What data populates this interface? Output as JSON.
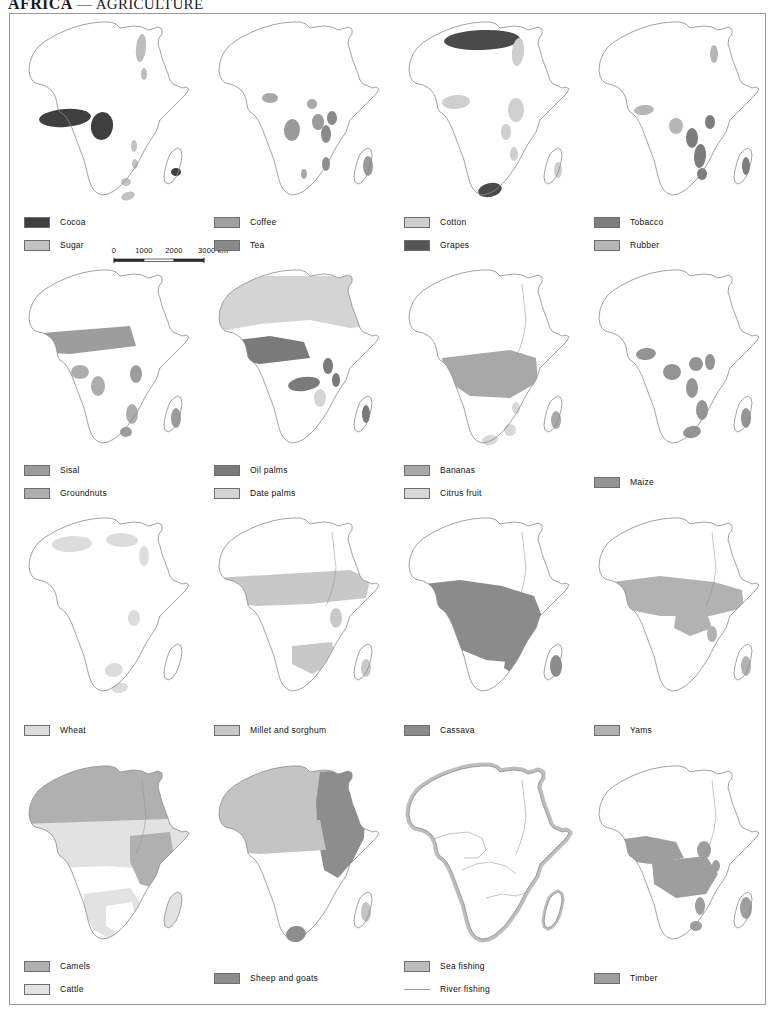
{
  "title": {
    "region": "AFRICA",
    "dash": "—",
    "topic": "AGRICULTURE"
  },
  "scale": {
    "ticks": [
      "0",
      "1000",
      "2000",
      "3000"
    ],
    "unit": "km",
    "unit_label": "3000 km"
  },
  "colors": {
    "outline": "#8c8c8c",
    "frame": "#9a9a9a",
    "swatch_border": "#6d6d6d",
    "dark": "#4a4a4a",
    "mid_dark": "#6f6f6f",
    "mid": "#8f8f8f",
    "mid_light": "#ababab",
    "light": "#c6c6c6",
    "very_light": "#dcdcdc",
    "river": "#9b9b9b"
  },
  "maps": [
    {
      "id": "cocoa-sugar",
      "row": 0,
      "col": 0,
      "legend": [
        {
          "label": "Cocoa",
          "type": "swatch",
          "color": "#3f3f3f"
        },
        {
          "label": "Sugar",
          "type": "swatch",
          "color": "#c2c2c2"
        }
      ],
      "has_scalebar": true
    },
    {
      "id": "coffee-tea",
      "row": 0,
      "col": 1,
      "legend": [
        {
          "label": "Coffee",
          "type": "swatch",
          "color": "#a0a0a0"
        },
        {
          "label": "Tea",
          "type": "swatch",
          "color": "#8a8a8a"
        }
      ],
      "has_scalebar": false
    },
    {
      "id": "cotton-grapes",
      "row": 0,
      "col": 2,
      "legend": [
        {
          "label": "Cotton",
          "type": "swatch",
          "color": "#cfcfcf"
        },
        {
          "label": "Grapes",
          "type": "swatch",
          "color": "#555555"
        }
      ],
      "has_scalebar": false
    },
    {
      "id": "tobacco-rubber",
      "row": 0,
      "col": 3,
      "legend": [
        {
          "label": "Tobacco",
          "type": "swatch",
          "color": "#7d7d7d"
        },
        {
          "label": "Rubber",
          "type": "swatch",
          "color": "#b6b6b6"
        }
      ],
      "has_scalebar": false
    },
    {
      "id": "sisal-groundnuts",
      "row": 1,
      "col": 0,
      "legend": [
        {
          "label": "Sisal",
          "type": "swatch",
          "color": "#9d9d9d"
        },
        {
          "label": "Groundnuts",
          "type": "swatch",
          "color": "#adadad"
        }
      ],
      "has_scalebar": false
    },
    {
      "id": "oil-date-palms",
      "row": 1,
      "col": 1,
      "legend": [
        {
          "label": "Oil palms",
          "type": "swatch",
          "color": "#7a7a7a"
        },
        {
          "label": "Date palms",
          "type": "swatch",
          "color": "#d4d4d4"
        }
      ],
      "has_scalebar": false
    },
    {
      "id": "bananas-citrus",
      "row": 1,
      "col": 2,
      "legend": [
        {
          "label": "Bananas",
          "type": "swatch",
          "color": "#a8a8a8"
        },
        {
          "label": "Citrus fruit",
          "type": "swatch",
          "color": "#d8d8d8"
        }
      ],
      "has_scalebar": false
    },
    {
      "id": "maize",
      "row": 1,
      "col": 3,
      "legend": [
        {
          "label": "Maize",
          "type": "swatch",
          "color": "#949494"
        }
      ],
      "legend_lower": true,
      "has_scalebar": false
    },
    {
      "id": "wheat",
      "row": 2,
      "col": 0,
      "legend": [
        {
          "label": "Wheat",
          "type": "swatch",
          "color": "#dcdcdc"
        }
      ],
      "legend_lower": true,
      "has_scalebar": false
    },
    {
      "id": "millet-sorghum",
      "row": 2,
      "col": 1,
      "legend": [
        {
          "label": "Millet and sorghum",
          "type": "swatch",
          "color": "#c8c8c8"
        }
      ],
      "legend_lower": true,
      "has_scalebar": false
    },
    {
      "id": "cassava",
      "row": 2,
      "col": 2,
      "legend": [
        {
          "label": "Cassava",
          "type": "swatch",
          "color": "#8b8b8b"
        }
      ],
      "legend_lower": true,
      "has_scalebar": false
    },
    {
      "id": "yams",
      "row": 2,
      "col": 3,
      "legend": [
        {
          "label": "Yams",
          "type": "swatch",
          "color": "#b2b2b2"
        }
      ],
      "legend_lower": true,
      "has_scalebar": false
    },
    {
      "id": "camels-cattle",
      "row": 3,
      "col": 0,
      "legend": [
        {
          "label": "Camels",
          "type": "swatch",
          "color": "#b0b0b0"
        },
        {
          "label": "Cattle",
          "type": "swatch",
          "color": "#e2e2e2"
        }
      ],
      "has_scalebar": false
    },
    {
      "id": "sheep-goats",
      "row": 3,
      "col": 1,
      "legend": [
        {
          "label": "Sheep and goats",
          "type": "swatch",
          "color": "#8d8d8d"
        }
      ],
      "legend_lower": true,
      "has_scalebar": false
    },
    {
      "id": "fishing",
      "row": 3,
      "col": 2,
      "legend": [
        {
          "label": "Sea fishing",
          "type": "swatch",
          "color": "#bdbdbd"
        },
        {
          "label": "River fishing",
          "type": "line",
          "color": "#9b9b9b"
        }
      ],
      "has_scalebar": false
    },
    {
      "id": "timber",
      "row": 3,
      "col": 3,
      "legend": [
        {
          "label": "Timber",
          "type": "swatch",
          "color": "#9e9e9e"
        }
      ],
      "legend_lower": true,
      "has_scalebar": false
    }
  ]
}
